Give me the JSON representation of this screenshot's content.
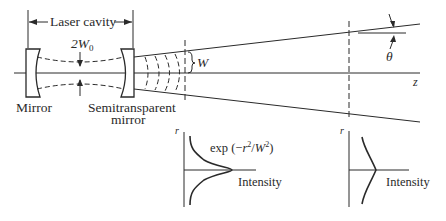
{
  "diagram": {
    "labels": {
      "laser_cavity": "Laser cavity",
      "beam_waist": "2W",
      "beam_waist_sub": "0",
      "mirror_left": "Mirror",
      "mirror_right_line1": "Semitransparent",
      "mirror_right_line2": "mirror",
      "beam_width": "W",
      "divergence_angle": "θ",
      "axis": "z"
    },
    "profile_near": {
      "axis_label": "r",
      "formula_prefix": "exp (−",
      "formula_r": "r",
      "formula_sup1": "2",
      "formula_slash": "/",
      "formula_W": "W",
      "formula_sup2": "2",
      "formula_suffix": ")",
      "x_label": "Intensity"
    },
    "profile_far": {
      "axis_label": "r",
      "x_label": "Intensity"
    }
  }
}
